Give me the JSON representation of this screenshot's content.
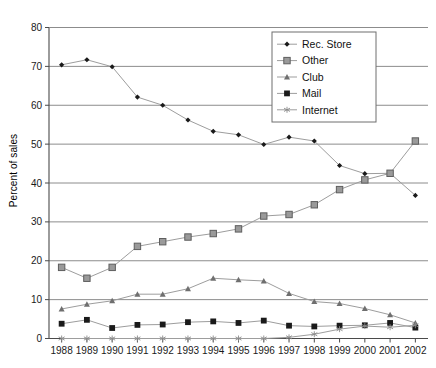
{
  "chart_data": {
    "type": "line",
    "title": "",
    "xlabel": "",
    "ylabel": "Percent of sales",
    "categories": [
      "1988",
      "1989",
      "1990",
      "1991",
      "1992",
      "1993",
      "1994",
      "1995",
      "1996",
      "1997",
      "1998",
      "1999",
      "2000",
      "2001",
      "2002"
    ],
    "ylim": [
      0,
      80
    ],
    "yticks": [
      0,
      10,
      20,
      30,
      40,
      50,
      60,
      70,
      80
    ],
    "grid": true,
    "legend_position": "top-right",
    "series": [
      {
        "name": "Rec. Store",
        "marker": "diamond",
        "color": "#1a1a1a",
        "values": [
          70.4,
          71.7,
          69.9,
          62.1,
          60.0,
          56.2,
          53.3,
          52.4,
          49.9,
          51.8,
          50.8,
          44.5,
          42.4,
          42.5,
          36.8
        ]
      },
      {
        "name": "Other",
        "marker": "square-gray",
        "color": "#7d7d7d",
        "values": [
          18.3,
          15.5,
          18.3,
          23.7,
          24.9,
          26.1,
          27.0,
          28.2,
          31.5,
          31.9,
          34.4,
          38.3,
          40.8,
          42.5,
          50.8
        ]
      },
      {
        "name": "Club",
        "marker": "triangle",
        "color": "#6f6f6f",
        "values": [
          7.6,
          8.8,
          9.7,
          11.4,
          11.4,
          12.8,
          15.5,
          15.1,
          14.8,
          11.6,
          9.5,
          9.0,
          7.7,
          6.1,
          4.0
        ]
      },
      {
        "name": "Mail",
        "marker": "square-black",
        "color": "#1a1a1a",
        "values": [
          3.8,
          4.8,
          2.7,
          3.5,
          3.6,
          4.2,
          4.4,
          4.0,
          4.6,
          3.3,
          3.1,
          3.3,
          3.4,
          4.0,
          2.8
        ]
      },
      {
        "name": "Internet",
        "marker": "asterisk",
        "color": "#8a8a8a",
        "values": [
          0.0,
          0.0,
          0.0,
          0.0,
          0.0,
          0.0,
          0.0,
          0.0,
          0.0,
          0.3,
          1.1,
          2.4,
          3.2,
          2.9,
          3.4
        ]
      }
    ]
  },
  "legend": {
    "items": [
      {
        "label": "Rec. Store"
      },
      {
        "label": "Other"
      },
      {
        "label": "Club"
      },
      {
        "label": "Mail"
      },
      {
        "label": "Internet"
      }
    ]
  }
}
